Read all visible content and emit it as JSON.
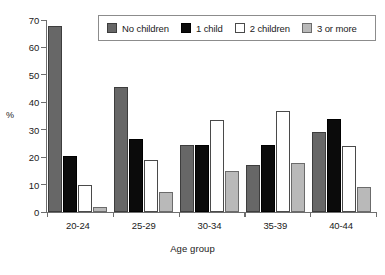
{
  "chart_data": {
    "type": "bar",
    "title": "",
    "subtitle": "",
    "xlabel": "Age group",
    "ylabel": "%",
    "ylim": [
      0,
      70
    ],
    "yticks": [
      0,
      10,
      20,
      30,
      40,
      50,
      60,
      70
    ],
    "ytick_labels": [
      "0",
      "10",
      "20",
      "30",
      "40",
      "50",
      "60",
      "70"
    ],
    "grid": false,
    "legend_position": "top-right-inside",
    "categories": [
      "20-24",
      "25-29",
      "30-34",
      "35-39",
      "40-44"
    ],
    "series": [
      {
        "name": "No children",
        "color": "#676767",
        "values": [
          68,
          45.5,
          24.5,
          17.3,
          29
        ]
      },
      {
        "name": "1 child",
        "color": "#0b0b0b",
        "values": [
          20.3,
          26.8,
          24.3,
          24.6,
          34
        ]
      },
      {
        "name": "2 children",
        "color": "#ffffff",
        "values": [
          9.7,
          18.8,
          33.6,
          37,
          24
        ]
      },
      {
        "name": "3 or more",
        "color": "#b9b9b9",
        "values": [
          2,
          7.3,
          15,
          17.9,
          9
        ]
      }
    ]
  }
}
